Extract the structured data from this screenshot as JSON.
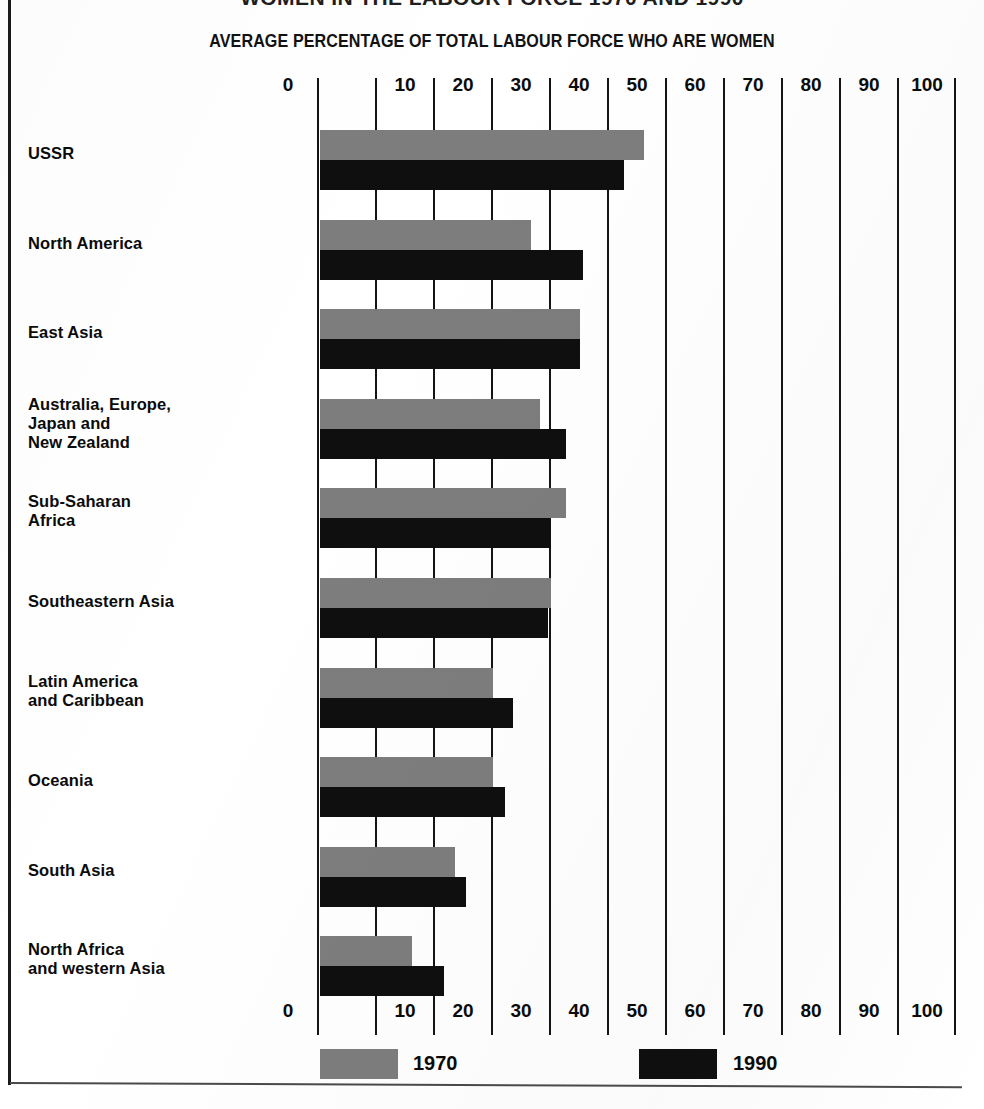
{
  "page": {
    "title": "WOMEN IN THE LABOUR FORCE 1970 AND 1990",
    "subtitle": "AVERAGE PERCENTAGE OF TOTAL LABOUR FORCE WHO ARE WOMEN"
  },
  "axis": {
    "ticks": [
      "0",
      "10",
      "20",
      "30",
      "40",
      "50",
      "60",
      "70",
      "80",
      "90",
      "100"
    ]
  },
  "legend": {
    "items": [
      {
        "label": "1970",
        "color": "#7d7d7d"
      },
      {
        "label": "1990",
        "color": "#100f0f"
      }
    ]
  },
  "chart_data": {
    "type": "bar",
    "orientation": "horizontal",
    "title": "WOMEN IN THE LABOUR FORCE 1970 AND 1990",
    "xlabel": "AVERAGE PERCENTAGE OF TOTAL LABOUR FORCE WHO ARE WOMEN",
    "ylabel": "",
    "xlim": [
      0,
      100
    ],
    "xticks": [
      0,
      10,
      20,
      30,
      40,
      50,
      60,
      70,
      80,
      90,
      100
    ],
    "grid": true,
    "legend_position": "bottom",
    "categories": [
      "USSR",
      "North America",
      "East Asia",
      "Australia, Europe, Japan and New Zealand",
      "Sub-Saharan Africa",
      "Southeastern Asia",
      "Latin America and Caribbean",
      "Oceania",
      "South Asia",
      "North Africa and western Asia"
    ],
    "category_lines": [
      [
        "USSR"
      ],
      [
        "North America"
      ],
      [
        "East Asia"
      ],
      [
        "Australia, Europe,",
        "Japan and",
        "New Zealand"
      ],
      [
        "Sub-Saharan",
        "Africa"
      ],
      [
        "Southeastern Asia"
      ],
      [
        "Latin America",
        "and Caribbean"
      ],
      [
        "Oceania"
      ],
      [
        "South Asia"
      ],
      [
        "North Africa",
        "and western Asia"
      ]
    ],
    "series": [
      {
        "name": "1970",
        "color": "#7d7d7d",
        "values": [
          55.5,
          36,
          44.5,
          37.5,
          42,
          39.5,
          29.5,
          29.5,
          23,
          15.5
        ]
      },
      {
        "name": "1990",
        "color": "#100f0f",
        "values": [
          52,
          45,
          44.5,
          42,
          39.5,
          39,
          33,
          31.5,
          24.8,
          21
        ]
      }
    ]
  }
}
